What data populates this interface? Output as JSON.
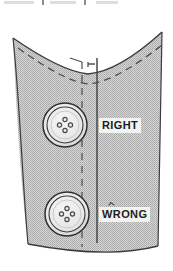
{
  "figure": {
    "name": "button-placement-diagram",
    "kind": "sewing-technical-illustration",
    "background_color": "#ffffff"
  },
  "fabric": {
    "name": "garment-panel",
    "fill_color": "#c9c9c9",
    "texture": "halftone-dot-screen",
    "texture_dot_color": "#a8a8a8",
    "outline_color": "#3c3c3c"
  },
  "lines": {
    "center_front": {
      "label": "center-front-line",
      "style": "solid",
      "color": "#4a4a4a",
      "x": 97,
      "y_top": 58,
      "y_bottom": 243
    },
    "placement_guide": {
      "label": "button-placement-dashed-line",
      "style": "dashed",
      "color": "#4d4d4d",
      "x": 82,
      "y_top": 62,
      "y_bottom": 247
    },
    "seam_allowance": {
      "label": "seam-allowance-dashed-line",
      "style": "dashed",
      "color": "#4d4d4d"
    },
    "tick_mark": {
      "label": "measurement-tick",
      "color": "#3a3a3a",
      "x": 90,
      "y": 64
    }
  },
  "buttons": [
    {
      "id": "button-right",
      "label": "RIGHT",
      "holes": 4,
      "center_x": 65,
      "center_y": 125,
      "outer_radius": 22,
      "rim_radius": 18,
      "face_color": "#e6e6e6",
      "edge_color": "#2f2f2f",
      "hole_color": "#4a4a4a",
      "state": "correct"
    },
    {
      "id": "button-wrong",
      "label": "WRONG",
      "holes": 4,
      "center_x": 67,
      "center_y": 214,
      "outer_radius": 22,
      "rim_radius": 18,
      "face_color": "#e6e6e6",
      "edge_color": "#2f2f2f",
      "hole_color": "#4a4a4a",
      "state": "incorrect"
    }
  ],
  "labels": {
    "right": {
      "text": "RIGHT",
      "box_color": "#f2f2f0",
      "text_color": "#1d1d1d"
    },
    "wrong": {
      "text": "WRONG",
      "box_color": "#f2f2f0",
      "text_color": "#1d1d1d",
      "has_caret_mark": true
    }
  },
  "artifacts": {
    "top_scan_marks": "faint cropped text row above figure"
  }
}
